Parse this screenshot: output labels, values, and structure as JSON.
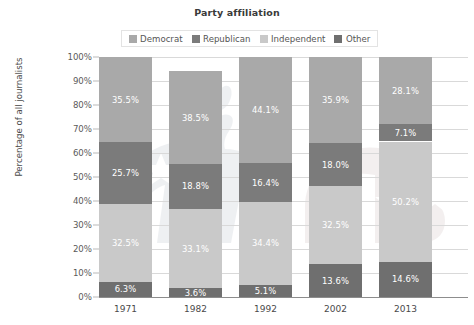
{
  "chart_data": {
    "type": "bar",
    "subtype": "stacked-100-percent",
    "title": "Party affiliation",
    "xlabel": "",
    "ylabel": "Percentage of all journalists",
    "ylim": [
      0,
      100
    ],
    "ytick_labels": [
      "0%",
      "10%",
      "20%",
      "30%",
      "40%",
      "50%",
      "60%",
      "70%",
      "80%",
      "90%",
      "100%"
    ],
    "ytick_values": [
      0,
      10,
      20,
      30,
      40,
      50,
      60,
      70,
      80,
      90,
      100
    ],
    "grid": true,
    "legend_position": "top-center",
    "categories": [
      "1971",
      "1982",
      "1992",
      "2002",
      "2013"
    ],
    "series": [
      {
        "name": "Other",
        "color": "#6f6f6f",
        "values": [
          6.3,
          3.6,
          5.1,
          13.6,
          14.6
        ],
        "labels": [
          "6.3%",
          "3.6%",
          "5.1%",
          "13.6%",
          "14.6%"
        ]
      },
      {
        "name": "Independent",
        "color": "#c9c9c9",
        "values": [
          32.5,
          33.1,
          34.4,
          32.5,
          50.2
        ],
        "labels": [
          "32.5%",
          "33.1%",
          "34.4%",
          "32.5%",
          "50.2%"
        ]
      },
      {
        "name": "Republican",
        "color": "#7b7b7b",
        "values": [
          25.7,
          18.8,
          16.4,
          18.0,
          7.1
        ],
        "labels": [
          "25.7%",
          "18.8%",
          "16.4%",
          "18.0%",
          "7.1%"
        ]
      },
      {
        "name": "Democrat",
        "color": "#a9a9a9",
        "values": [
          35.5,
          38.5,
          44.1,
          35.9,
          28.1
        ],
        "labels": [
          "35.5%",
          "38.5%",
          "44.1%",
          "35.9%",
          "28.1%"
        ]
      }
    ]
  },
  "legend": {
    "items": [
      {
        "label": "Democrat",
        "color": "#a9a9a9"
      },
      {
        "label": "Republican",
        "color": "#7b7b7b"
      },
      {
        "label": "Independent",
        "color": "#c9c9c9"
      },
      {
        "label": "Other",
        "color": "#6f6f6f"
      }
    ]
  }
}
